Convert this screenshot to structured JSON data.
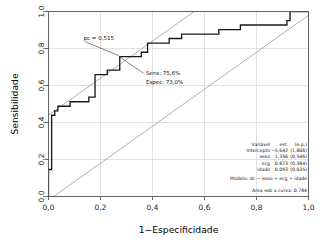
{
  "chart_data": {
    "type": "line",
    "title": "",
    "xlabel": "1−Especificidade",
    "ylabel": "Sensibilidade",
    "xlim": [
      0,
      1
    ],
    "ylim": [
      0,
      1
    ],
    "grid": true,
    "legend": "none",
    "xticks": [
      "0,0",
      "0,2",
      "0,4",
      "0,6",
      "0,8",
      "1,0"
    ],
    "xtick_values": [
      0.0,
      0.2,
      0.4,
      0.6,
      0.8,
      1.0
    ],
    "yticks": [
      "0,0",
      "0,2",
      "0,4",
      "0,6",
      "0,8",
      "1,0"
    ],
    "ytick_values": [
      0.0,
      0.2,
      0.4,
      0.6,
      0.8,
      1.0
    ],
    "series": [
      {
        "name": "Curva ROC",
        "color": "#1a1a1a",
        "style": "step",
        "x": [
          0.0,
          0.0,
          0.012,
          0.012,
          0.024,
          0.024,
          0.036,
          0.036,
          0.06,
          0.06,
          0.083,
          0.083,
          0.107,
          0.107,
          0.131,
          0.131,
          0.155,
          0.155,
          0.179,
          0.179,
          0.19,
          0.19,
          0.202,
          0.202,
          0.226,
          0.226,
          0.262,
          0.262,
          0.274,
          0.274,
          0.333,
          0.333,
          0.357,
          0.357,
          0.381,
          0.381,
          0.44,
          0.44,
          0.464,
          0.464,
          0.476,
          0.476,
          0.512,
          0.512,
          0.571,
          0.571,
          0.655,
          0.655,
          0.738,
          0.738,
          0.833,
          0.833,
          0.917,
          0.917,
          0.929,
          0.929,
          1.0
        ],
        "y": [
          0.0,
          0.146,
          0.146,
          0.439,
          0.439,
          0.463,
          0.463,
          0.488,
          0.488,
          0.488,
          0.488,
          0.512,
          0.512,
          0.512,
          0.512,
          0.512,
          0.512,
          0.537,
          0.537,
          0.659,
          0.659,
          0.659,
          0.659,
          0.659,
          0.659,
          0.683,
          0.683,
          0.683,
          0.683,
          0.756,
          0.756,
          0.756,
          0.756,
          0.78,
          0.78,
          0.829,
          0.829,
          0.829,
          0.829,
          0.854,
          0.854,
          0.854,
          0.854,
          0.878,
          0.878,
          0.878,
          0.878,
          0.902,
          0.902,
          0.927,
          0.927,
          0.927,
          0.927,
          0.951,
          0.951,
          1.0,
          1.0
        ]
      },
      {
        "name": "Diagonal de referência superior",
        "color": "#9a9a9a",
        "style": "line",
        "x": [
          0.0,
          1.0
        ],
        "y": [
          0.44,
          1.44
        ]
      },
      {
        "name": "Diagonal de referência inferior",
        "color": "#9a9a9a",
        "style": "line",
        "x": [
          0.0,
          1.0
        ],
        "y": [
          -0.02,
          0.98
        ]
      }
    ],
    "annotations": [
      {
        "name": "cutoff-label",
        "text": "pc = 0,515",
        "x": 0.135,
        "y": 0.845
      },
      {
        "name": "cutoff-point",
        "x": 0.274,
        "y": 0.756
      },
      {
        "name": "sensitivity-text",
        "text": "Sens: 75,6%",
        "x": 0.375,
        "y": 0.655
      },
      {
        "name": "specificity-text",
        "text": "Espec: 73,0%",
        "x": 0.375,
        "y": 0.608
      }
    ]
  },
  "stats_table": {
    "headers": [
      "Variável",
      "est.",
      "(e.p.)"
    ],
    "rows": [
      {
        "variable": "Intercepto",
        "estimate": "−5,642",
        "se": "(1,806)"
      },
      {
        "variable": "sexo",
        "estimate": "1,356",
        "se": "(0,546)"
      },
      {
        "variable": "ecg",
        "estimate": "0,873",
        "se": "(0,384)"
      },
      {
        "variable": "idade",
        "estimate": "0,093",
        "se": "(0,035)"
      }
    ]
  },
  "model_info": {
    "formula": "Modelo:  dc ~ sexo + ecg + idade",
    "auc": "Área sob a curva: 0,784"
  },
  "colors": {
    "curve": "#1a1a1a",
    "reference": "#9a9a9a",
    "grid": "#d7d7d7",
    "frame": "#555555",
    "text": "#111111",
    "background": "#ffffff"
  }
}
